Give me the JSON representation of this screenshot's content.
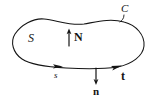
{
  "figure": {
    "background_color": "#ffffff",
    "ink_color": "#141414",
    "width": 157,
    "height": 103,
    "labels": {
      "surface": "S",
      "curve": "C",
      "unit_normal_up": "N",
      "unit_normal_down": "n",
      "unit_tangent": "t",
      "arc_length": "s"
    },
    "elements": {
      "boundary_curve_name": "closed-blob-boundary",
      "leader_line_name": "curve-label-leader-line",
      "normal_up_arrow_name": "normal-vector-N-arrow",
      "normal_down_arrow_name": "normal-vector-n-arrow",
      "tangent_arrow_name": "tangent-vector-t-arrowhead",
      "orientation_arrow_name": "arc-length-s-arrowhead"
    }
  }
}
